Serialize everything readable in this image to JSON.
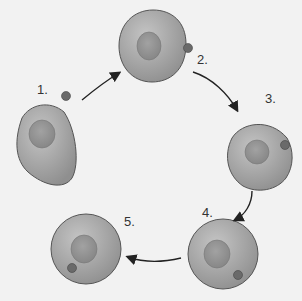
{
  "diagram": {
    "type": "cell-cycle-endocytosis",
    "steps": [
      {
        "label": "1.",
        "description": "particle approaches cell"
      },
      {
        "label": "2.",
        "description": "particle contacts membrane"
      },
      {
        "label": "3.",
        "description": "membrane invaginates around particle"
      },
      {
        "label": "4.",
        "description": "membrane pinches off"
      },
      {
        "label": "5.",
        "description": "vesicle inside cell"
      }
    ],
    "colors": {
      "background": "#f2f2f2",
      "cell_fill": "#a9a9a9",
      "cell_outline": "#555555",
      "nucleus_fill": "#8e8e8e",
      "particle_fill": "#6a6a6a",
      "arrow": "#222222"
    }
  }
}
